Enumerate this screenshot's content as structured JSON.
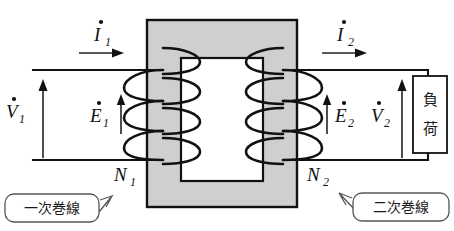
{
  "diagram": {
    "core": {
      "fill": "#cfcfcf",
      "stroke": "#111111"
    },
    "labels": {
      "current_primary": {
        "symbol": "I",
        "subscript": "1",
        "overdot": true
      },
      "current_secondary": {
        "symbol": "I",
        "subscript": "2",
        "overdot": true
      },
      "voltage_primary": {
        "symbol": "V",
        "subscript": "1",
        "overdot": true
      },
      "voltage_secondary": {
        "symbol": "V",
        "subscript": "2",
        "overdot": true
      },
      "emf_primary": {
        "symbol": "E",
        "subscript": "1",
        "overdot": true
      },
      "emf_secondary": {
        "symbol": "E",
        "subscript": "2",
        "overdot": true
      },
      "turns_primary": {
        "symbol": "N",
        "subscript": "1",
        "overdot": false
      },
      "turns_secondary": {
        "symbol": "N",
        "subscript": "2",
        "overdot": false
      }
    },
    "load": {
      "line1": "負",
      "line2": "荷"
    },
    "callouts": {
      "primary_winding": "一次巻線",
      "secondary_winding": "二次巻線"
    }
  }
}
